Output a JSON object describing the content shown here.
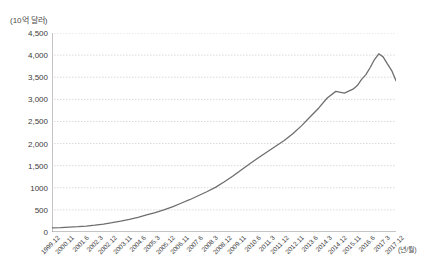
{
  "chart_data": {
    "type": "line",
    "title": "",
    "ylabel": "(10억 달러)",
    "xlabel": "(년/월)",
    "ylim": [
      0,
      4500
    ],
    "yticks": [
      "0",
      "500",
      "1000",
      "1,500",
      "2,000",
      "2,500",
      "3,000",
      "3,500",
      "4,000",
      "4,500"
    ],
    "ytick_values": [
      0,
      500,
      1000,
      1500,
      2000,
      2500,
      3000,
      3500,
      4000,
      4500
    ],
    "grid": true,
    "legend": "none",
    "categories": [
      "1999.12",
      "2000.11",
      "2001.6",
      "2002.3",
      "2002.12",
      "2003.11",
      "2004.6",
      "2005.3",
      "2005.12",
      "2006.11",
      "2007.6",
      "2008.3",
      "2008.12",
      "2009.11",
      "2010.6",
      "2011.3",
      "2011.12",
      "2012.11",
      "2013.6",
      "2014.3",
      "2014.12",
      "2015.11",
      "2016.6",
      "2017.3",
      "2017.12"
    ],
    "series": [
      {
        "name": "외환보유액",
        "color": "#6e6e6e",
        "x": [
          0,
          6,
          12,
          18,
          24,
          30,
          36,
          42,
          48,
          54,
          60,
          66,
          72,
          78,
          84,
          90,
          96,
          102,
          108,
          114,
          120,
          126,
          132,
          138,
          144,
          150,
          156,
          162,
          168,
          174,
          180,
          186,
          192,
          198,
          204,
          210,
          213,
          216,
          219,
          222,
          225,
          228,
          231,
          234,
          237,
          240
        ],
        "values": [
          95,
          100,
          110,
          120,
          135,
          155,
          180,
          210,
          245,
          285,
          330,
          385,
          440,
          500,
          570,
          650,
          730,
          820,
          910,
          1010,
          1130,
          1260,
          1400,
          1545,
          1680,
          1810,
          1940,
          2070,
          2220,
          2400,
          2600,
          2800,
          3030,
          3180,
          3140,
          3230,
          3310,
          3450,
          3560,
          3720,
          3900,
          4030,
          3960,
          3800,
          3650,
          3420
        ]
      }
    ],
    "peak": {
      "value": 4050,
      "label": "2014.3"
    },
    "end_value": 3120,
    "start_value": 95
  },
  "axis": {
    "y_title": "(10억 달러)",
    "x_title": "(년/월)"
  }
}
